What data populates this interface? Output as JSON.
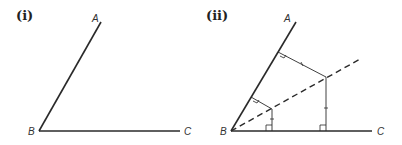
{
  "panels": [
    {
      "id": "i",
      "label": "(i)",
      "points": {
        "A": "A",
        "B": "B",
        "C": "C"
      },
      "description": "Angle ABC formed by rays BA and BC"
    },
    {
      "id": "ii",
      "label": "(ii)",
      "points": {
        "A": "A",
        "B": "B",
        "C": "C"
      },
      "description": "Angle ABC with dashed angle bisector; two points on bisector with perpendiculars to BA and BC, right-angle marks and equal-length tick marks"
    }
  ],
  "colors": {
    "line": "#2a2a2a",
    "text": "#333333",
    "background": "#ffffff"
  }
}
